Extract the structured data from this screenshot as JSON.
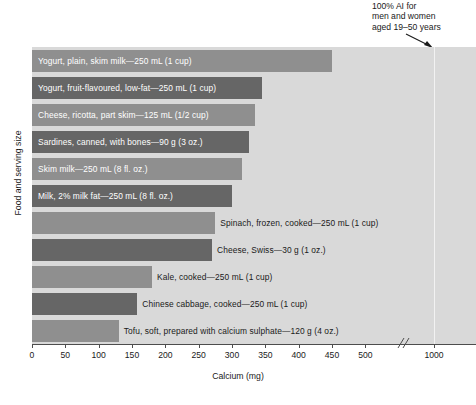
{
  "annotation": {
    "text": "100% AI for\nmen and women\naged 19–50 years",
    "arrow_name": "annotation-arrow"
  },
  "axes": {
    "xlabel": "Calcium (mg)",
    "ylabel": "Food and serving size",
    "xticks": [
      "0",
      "50",
      "100",
      "150",
      "200",
      "250",
      "300",
      "350",
      "400",
      "450",
      "500",
      "1000"
    ],
    "break_symbol": "//"
  },
  "colors": {
    "plot_background": "#d9d9d9",
    "bar_light": "#8f8f8f",
    "bar_dark": "#666666",
    "reference_line": "#f2f2f2",
    "axis": "#4d4d4d",
    "text": "#1a1a1a",
    "label_inside": "#ffffff"
  },
  "chart_data": {
    "type": "bar",
    "orientation": "horizontal",
    "title": "",
    "xlabel": "Calcium (mg)",
    "ylabel": "Food and serving size",
    "xlim": [
      0,
      1100
    ],
    "xticks": [
      0,
      50,
      100,
      150,
      200,
      250,
      300,
      350,
      400,
      450,
      500,
      1000
    ],
    "axis_break": {
      "after": 500,
      "before": 1000,
      "symbol": "//"
    },
    "grid": false,
    "legend": null,
    "reference_line": {
      "value": 1000,
      "label": "100% AI for men and women aged 19–50 years",
      "color": "#f2f2f2"
    },
    "categories": [
      "Yogurt, plain, skim milk—250 mL (1 cup)",
      "Yogurt, fruit-flavoured, low-fat—250 mL (1 cup)",
      "Cheese, ricotta, part skim—125 mL (1/2 cup)",
      "Sardines, canned, with bones—90 g (3 oz.)",
      "Skim milk—250 mL (8 fl. oz.)",
      "Milk, 2% milk fat—250 mL (8 fl. oz.)",
      "Spinach, frozen, cooked—250 mL (1 cup)",
      "Cheese, Swiss—30 g (1 oz.)",
      "Kale, cooked—250 mL (1 cup)",
      "Chinese cabbage, cooked—250 mL (1 cup)",
      "Tofu, soft, prepared with calcium sulphate—120 g (4 oz.)"
    ],
    "values": [
      450,
      345,
      335,
      325,
      315,
      300,
      275,
      270,
      180,
      158,
      130
    ]
  },
  "bars": [
    {
      "label": "Yogurt, plain, skim milk—250 mL (1 cup)",
      "value": 450,
      "shade": "light",
      "label_position": "inside"
    },
    {
      "label": "Yogurt, fruit-flavoured, low-fat—250 mL (1 cup)",
      "value": 345,
      "shade": "dark",
      "label_position": "inside"
    },
    {
      "label": "Cheese, ricotta, part skim—125 mL (1/2 cup)",
      "value": 335,
      "shade": "light",
      "label_position": "inside"
    },
    {
      "label": "Sardines, canned, with bones—90 g (3 oz.)",
      "value": 325,
      "shade": "dark",
      "label_position": "inside"
    },
    {
      "label": "Skim milk—250 mL (8 fl. oz.)",
      "value": 315,
      "shade": "light",
      "label_position": "inside"
    },
    {
      "label": "Milk, 2% milk fat—250 mL (8 fl. oz.)",
      "value": 300,
      "shade": "dark",
      "label_position": "inside"
    },
    {
      "label": "Spinach, frozen, cooked—250 mL (1 cup)",
      "value": 275,
      "shade": "light",
      "label_position": "outside"
    },
    {
      "label": "Cheese, Swiss—30 g (1 oz.)",
      "value": 270,
      "shade": "dark",
      "label_position": "outside"
    },
    {
      "label": "Kale, cooked—250 mL (1 cup)",
      "value": 180,
      "shade": "light",
      "label_position": "outside"
    },
    {
      "label": "Chinese cabbage, cooked—250 mL (1 cup)",
      "value": 158,
      "shade": "dark",
      "label_position": "outside"
    },
    {
      "label": "Tofu, soft, prepared with calcium sulphate—120 g (4 oz.)",
      "value": 130,
      "shade": "light",
      "label_position": "outside"
    }
  ]
}
